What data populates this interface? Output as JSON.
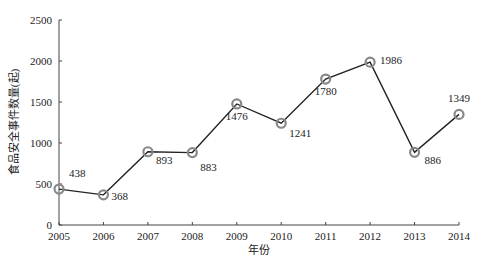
{
  "chart_data": {
    "type": "line",
    "title": "",
    "xlabel": "年份",
    "ylabel": "食品安全事件数量(起)",
    "categories": [
      "2005",
      "2006",
      "2007",
      "2008",
      "2009",
      "2010",
      "2011",
      "2012",
      "2013",
      "2014"
    ],
    "series": [
      {
        "name": "食品安全事件数量",
        "values": [
          438,
          368,
          893,
          883,
          1476,
          1241,
          1780,
          1986,
          886,
          1349
        ]
      }
    ],
    "data_labels": [
      "438",
      "368",
      "893",
      "883",
      "1476",
      "1241",
      "1780",
      "1986",
      "886",
      "1349"
    ],
    "yticks": [
      "0",
      "500",
      "1000",
      "1500",
      "2000",
      "2500"
    ],
    "ylim": [
      0,
      2500
    ],
    "grid": false,
    "legend": "none",
    "colors": {
      "line": "#222222",
      "marker": "#888888",
      "axis": "#444444",
      "text": "#222222"
    }
  }
}
